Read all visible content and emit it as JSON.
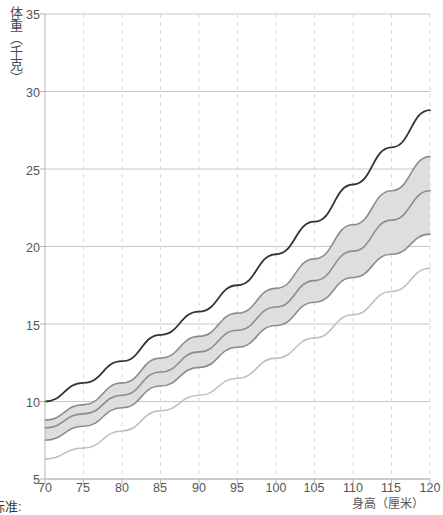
{
  "axes": {
    "ylabel": "体重（千克）",
    "xlabel": "身高（厘米）",
    "yticks": [
      "5",
      "10",
      "15",
      "20",
      "25",
      "30",
      "35"
    ],
    "xticks": [
      "70",
      "75",
      "80",
      "85",
      "90",
      "95",
      "100",
      "105",
      "110",
      "115",
      "120"
    ]
  },
  "footnote": "标准:",
  "colors": {
    "top_line": "#333333",
    "band_edge": "#8c8c8c",
    "band_fill": "#dedede",
    "low_line": "#bfbfbf",
    "grid_solid": "#c8c8c8",
    "grid_dashed": "#d8d8d8",
    "text": "#555555"
  },
  "chart_data": {
    "type": "line",
    "title": "",
    "xlabel": "身高（厘米）",
    "ylabel": "体重（千克）",
    "xlim": [
      70,
      120
    ],
    "ylim": [
      5,
      35
    ],
    "xticks": [
      70,
      75,
      80,
      85,
      90,
      95,
      100,
      105,
      110,
      115,
      120
    ],
    "yticks": [
      5,
      10,
      15,
      20,
      25,
      30,
      35
    ],
    "grid": "horizontal solid, vertical dashed",
    "legend": "none",
    "x": [
      70,
      75,
      80,
      85,
      90,
      95,
      100,
      105,
      110,
      115,
      120
    ],
    "series": [
      {
        "name": "upper-reference-line",
        "color": "#333333",
        "values": [
          10.0,
          11.2,
          12.6,
          14.3,
          15.8,
          17.5,
          19.5,
          21.6,
          24.0,
          26.4,
          28.8
        ]
      },
      {
        "name": "band-upper-edge",
        "color": "#8c8c8c",
        "values": [
          8.8,
          9.8,
          11.2,
          12.8,
          14.2,
          15.7,
          17.3,
          19.2,
          21.4,
          23.6,
          25.8
        ]
      },
      {
        "name": "median-line",
        "color": "#8c8c8c",
        "values": [
          8.3,
          9.2,
          10.4,
          11.9,
          13.2,
          14.6,
          16.1,
          17.8,
          19.7,
          21.7,
          23.6
        ]
      },
      {
        "name": "band-lower-edge",
        "color": "#8c8c8c",
        "values": [
          7.5,
          8.4,
          9.6,
          11.0,
          12.2,
          13.5,
          14.9,
          16.4,
          18.0,
          19.5,
          20.8
        ]
      },
      {
        "name": "lower-reference-line",
        "color": "#bfbfbf",
        "values": [
          6.3,
          7.0,
          8.1,
          9.4,
          10.4,
          11.5,
          12.8,
          14.1,
          15.6,
          17.1,
          18.6
        ]
      }
    ],
    "shaded_band": {
      "between": [
        "band-upper-edge",
        "band-lower-edge"
      ],
      "fill": "#dedede"
    }
  }
}
